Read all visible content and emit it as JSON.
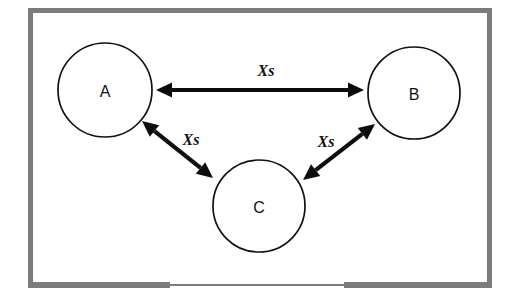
{
  "diagram": {
    "background_color": "#ffffff",
    "frame": {
      "name": "whiteboard-frame",
      "color": "#7c7c7c",
      "tray_color": "#7c7c7c"
    },
    "nodes": [
      {
        "id": "A",
        "label": "A",
        "cx": 105,
        "cy": 90,
        "r": 47
      },
      {
        "id": "B",
        "label": "B",
        "cx": 414,
        "cy": 93,
        "r": 46
      },
      {
        "id": "C",
        "label": "C",
        "cx": 259,
        "cy": 206,
        "r": 46
      }
    ],
    "links": [
      {
        "id": "A-B",
        "from": "A",
        "to": "B",
        "label": "Xs",
        "label_x": 266,
        "label_y": 70,
        "x1": 156,
        "y1": 90,
        "x2": 364,
        "y2": 90,
        "color": "#0d0d0d"
      },
      {
        "id": "A-C",
        "from": "A",
        "to": "C",
        "label": "Xs",
        "label_x": 191,
        "label_y": 139,
        "x1": 142,
        "y1": 121,
        "x2": 213,
        "y2": 178,
        "color": "#0d0d0d"
      },
      {
        "id": "C-B",
        "from": "C",
        "to": "B",
        "label": "Xs",
        "label_x": 326,
        "label_y": 141,
        "x1": 303,
        "y1": 180,
        "x2": 375,
        "y2": 124,
        "color": "#0d0d0d"
      }
    ]
  }
}
